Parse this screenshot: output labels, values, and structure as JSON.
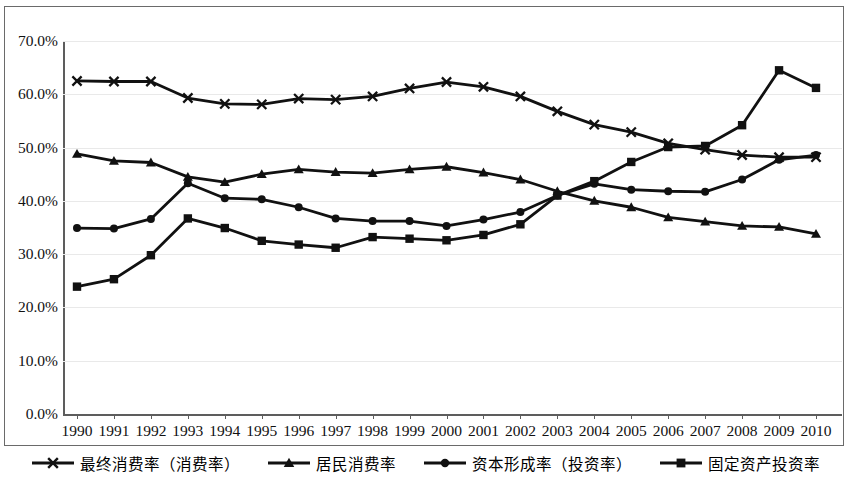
{
  "chart_data": {
    "type": "line",
    "title": "",
    "xlabel": "",
    "ylabel": "",
    "ylim": [
      0,
      70
    ],
    "ytick_labels": [
      "0.0%",
      "10.0%",
      "20.0%",
      "30.0%",
      "40.0%",
      "50.0%",
      "60.0%",
      "70.0%"
    ],
    "ytick_values": [
      0,
      10,
      20,
      30,
      40,
      50,
      60,
      70
    ],
    "grid": true,
    "legend_position": "bottom",
    "categories": [
      "1990",
      "1991",
      "1992",
      "1993",
      "1994",
      "1995",
      "1996",
      "1997",
      "1998",
      "1999",
      "2000",
      "2001",
      "2002",
      "2003",
      "2004",
      "2005",
      "2006",
      "2007",
      "2008",
      "2009",
      "2010"
    ],
    "series": [
      {
        "name": "最终消费率（消费率）",
        "marker": "x",
        "color": "#111111",
        "values": [
          62.5,
          62.4,
          62.4,
          59.3,
          58.2,
          58.1,
          59.2,
          59.0,
          59.6,
          61.1,
          62.3,
          61.4,
          59.6,
          56.8,
          54.3,
          52.9,
          50.8,
          49.6,
          48.6,
          48.2,
          48.2
        ]
      },
      {
        "name": "居民消费率",
        "marker": "triangle",
        "color": "#111111",
        "values": [
          48.8,
          47.5,
          47.2,
          44.5,
          43.5,
          45.0,
          45.9,
          45.4,
          45.2,
          45.9,
          46.4,
          45.3,
          44.0,
          41.8,
          40.0,
          38.8,
          36.9,
          36.1,
          35.3,
          35.1,
          33.8
        ]
      },
      {
        "name": "资本形成率（投资率）",
        "marker": "circle",
        "color": "#111111",
        "values": [
          34.9,
          34.8,
          36.6,
          43.3,
          40.5,
          40.3,
          38.8,
          36.7,
          36.2,
          36.2,
          35.3,
          36.5,
          37.9,
          41.0,
          43.2,
          42.1,
          41.8,
          41.7,
          44.0,
          47.7,
          48.6
        ]
      },
      {
        "name": "固定资产投资率",
        "marker": "square",
        "color": "#111111",
        "values": [
          23.9,
          25.3,
          29.8,
          36.7,
          34.9,
          32.5,
          31.8,
          31.2,
          33.2,
          32.9,
          32.6,
          33.6,
          35.6,
          41.0,
          43.7,
          47.3,
          50.1,
          50.3,
          54.2,
          64.5,
          61.2
        ]
      }
    ]
  },
  "legend": {
    "items": [
      {
        "label": "最终消费率（消费率）",
        "marker": "x"
      },
      {
        "label": "居民消费率",
        "marker": "triangle"
      },
      {
        "label": "资本形成率（投资率）",
        "marker": "circle"
      },
      {
        "label": "固定资产投资率",
        "marker": "square"
      }
    ]
  }
}
